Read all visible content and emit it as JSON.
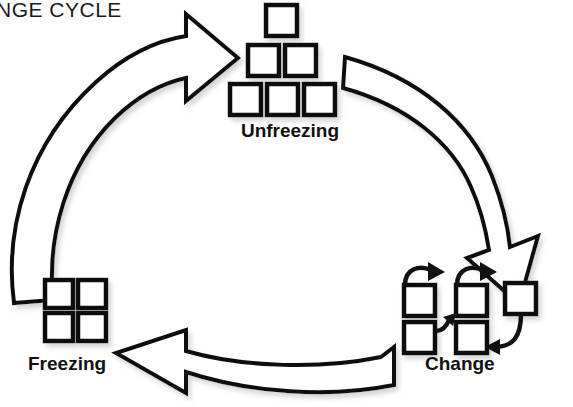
{
  "title": {
    "text": "NGE CYCLE",
    "full_text_clipped": true
  },
  "diagram": {
    "type": "cycle",
    "direction": "clockwise",
    "accent_color": "#111111",
    "background_color": "#ffffff",
    "stages": [
      {
        "id": "unfreezing",
        "label": "Unfreezing",
        "position": "top",
        "box_count": 6,
        "arrangement": "pyramid-1-2-3"
      },
      {
        "id": "change",
        "label": "Change",
        "position": "bottom-right",
        "box_count": 5,
        "arrangement": "scattered-with-curved-arrows"
      },
      {
        "id": "freezing",
        "label": "Freezing",
        "position": "bottom-left",
        "box_count": 4,
        "arrangement": "grid-2x2"
      }
    ],
    "connectors": [
      {
        "id": "freezing-to-unfreezing",
        "from": "freezing",
        "to": "unfreezing",
        "style": "hollow-curved-arrow",
        "side": "left"
      },
      {
        "id": "unfreezing-to-change",
        "from": "unfreezing",
        "to": "change",
        "style": "hollow-curved-arrow",
        "side": "right"
      },
      {
        "id": "change-to-freezing",
        "from": "change",
        "to": "freezing",
        "style": "hollow-curved-arrow",
        "side": "bottom"
      }
    ]
  }
}
